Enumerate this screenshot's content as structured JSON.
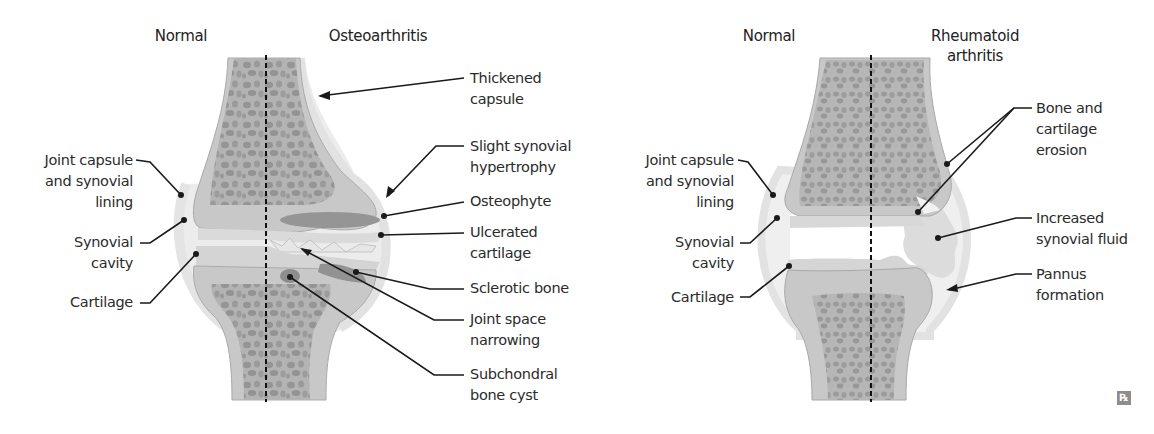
{
  "diagram": {
    "colors": {
      "bone_outer": "#c9c9c9",
      "bone_trabecular": "#a9a9a9",
      "trabecular_holes": "#8f8f8f",
      "cartilage": "#d6d6d6",
      "capsule": "#e8e8e8",
      "sclerotic": "#8c8c8c",
      "midline": "#111111",
      "leader": "#1a1a1a"
    },
    "left_panel": {
      "title_left": "Normal",
      "title_right": "Osteoarthritis",
      "left_labels": [
        {
          "id": "joint-capsule",
          "lines": [
            "Joint capsule",
            "and synovial",
            "lining"
          ]
        },
        {
          "id": "synovial-cavity",
          "lines": [
            "Synovial",
            "cavity"
          ]
        },
        {
          "id": "cartilage",
          "lines": [
            "Cartilage"
          ]
        }
      ],
      "right_labels": [
        {
          "id": "thickened-capsule",
          "lines": [
            "Thickened",
            "capsule"
          ]
        },
        {
          "id": "synovial-hypertrophy",
          "lines": [
            "Slight synovial",
            "hypertrophy"
          ]
        },
        {
          "id": "osteophyte",
          "lines": [
            "Osteophyte"
          ]
        },
        {
          "id": "ulcerated-cartilage",
          "lines": [
            "Ulcerated",
            "cartilage"
          ]
        },
        {
          "id": "sclerotic-bone",
          "lines": [
            "Sclerotic bone"
          ]
        },
        {
          "id": "joint-space-narrowing",
          "lines": [
            "Joint space",
            "narrowing"
          ]
        },
        {
          "id": "subchondral-cyst",
          "lines": [
            "Subchondral",
            "bone cyst"
          ]
        }
      ]
    },
    "right_panel": {
      "title_left": "Normal",
      "title_right": [
        "Rheumatoid",
        "arthritis"
      ],
      "left_labels": [
        {
          "id": "joint-capsule",
          "lines": [
            "Joint capsule",
            "and synovial",
            "lining"
          ]
        },
        {
          "id": "synovial-cavity",
          "lines": [
            "Synovial",
            "cavity"
          ]
        },
        {
          "id": "cartilage",
          "lines": [
            "Cartilage"
          ]
        }
      ],
      "right_labels": [
        {
          "id": "erosion",
          "lines": [
            "Bone and",
            "cartilage",
            "erosion"
          ]
        },
        {
          "id": "increased-fluid",
          "lines": [
            "Increased",
            "synovial fluid"
          ]
        },
        {
          "id": "pannus",
          "lines": [
            "Pannus",
            "formation"
          ]
        }
      ]
    },
    "logo": "℞"
  }
}
